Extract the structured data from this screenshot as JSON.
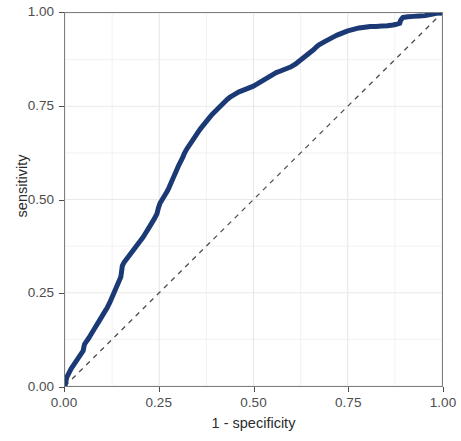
{
  "chart_data": {
    "type": "line",
    "title": "",
    "subtitle": "",
    "xlabel": "1 - specificity",
    "ylabel": "sensitivity",
    "xlim": [
      0,
      1
    ],
    "ylim": [
      0,
      1
    ],
    "xticks": [
      "0.00",
      "0.25",
      "0.50",
      "0.75",
      "1.00"
    ],
    "xtick_values": [
      0,
      0.25,
      0.5,
      0.75,
      1
    ],
    "yticks": [
      "0.00",
      "0.25",
      "0.50",
      "0.75",
      "1.00"
    ],
    "ytick_values": [
      0,
      0.25,
      0.5,
      0.75,
      1
    ],
    "grid": true,
    "grid_color": "#ebebeb",
    "legend": "none",
    "panel_background": "#ffffff",
    "panel_border_color": "#7f7f7f",
    "series": [
      {
        "name": "roc-curve",
        "color": "#1b3a75",
        "linewidth": 5,
        "linestyle": "solid",
        "x": [
          0.0,
          0.002,
          0.004,
          0.006,
          0.008,
          0.01,
          0.012,
          0.016,
          0.02,
          0.024,
          0.028,
          0.032,
          0.036,
          0.04,
          0.044,
          0.048,
          0.05,
          0.052,
          0.056,
          0.06,
          0.064,
          0.07,
          0.076,
          0.082,
          0.088,
          0.094,
          0.1,
          0.106,
          0.112,
          0.118,
          0.124,
          0.13,
          0.136,
          0.142,
          0.148,
          0.15,
          0.152,
          0.156,
          0.16,
          0.166,
          0.172,
          0.178,
          0.184,
          0.19,
          0.196,
          0.202,
          0.208,
          0.214,
          0.22,
          0.226,
          0.232,
          0.238,
          0.244,
          0.248,
          0.252,
          0.258,
          0.264,
          0.27,
          0.276,
          0.282,
          0.288,
          0.294,
          0.3,
          0.306,
          0.312,
          0.316,
          0.32,
          0.326,
          0.334,
          0.342,
          0.35,
          0.358,
          0.366,
          0.374,
          0.382,
          0.39,
          0.398,
          0.406,
          0.414,
          0.422,
          0.43,
          0.44,
          0.45,
          0.46,
          0.47,
          0.48,
          0.49,
          0.5,
          0.51,
          0.52,
          0.53,
          0.54,
          0.55,
          0.56,
          0.57,
          0.58,
          0.59,
          0.6,
          0.61,
          0.62,
          0.63,
          0.64,
          0.65,
          0.66,
          0.668,
          0.676,
          0.69,
          0.705,
          0.72,
          0.735,
          0.75,
          0.765,
          0.78,
          0.795,
          0.81,
          0.825,
          0.84,
          0.855,
          0.87,
          0.88,
          0.888,
          0.89,
          0.896,
          0.91,
          0.925,
          0.94,
          0.955,
          0.965,
          0.975,
          0.985,
          1.0
        ],
        "y": [
          0.0,
          0.012,
          0.02,
          0.026,
          0.03,
          0.034,
          0.038,
          0.046,
          0.052,
          0.058,
          0.064,
          0.07,
          0.076,
          0.082,
          0.088,
          0.094,
          0.104,
          0.112,
          0.118,
          0.124,
          0.13,
          0.14,
          0.15,
          0.16,
          0.17,
          0.18,
          0.19,
          0.2,
          0.21,
          0.222,
          0.236,
          0.25,
          0.264,
          0.278,
          0.292,
          0.306,
          0.322,
          0.33,
          0.336,
          0.344,
          0.352,
          0.36,
          0.368,
          0.376,
          0.384,
          0.392,
          0.4,
          0.41,
          0.42,
          0.43,
          0.44,
          0.45,
          0.462,
          0.478,
          0.49,
          0.5,
          0.51,
          0.52,
          0.532,
          0.546,
          0.56,
          0.574,
          0.588,
          0.6,
          0.612,
          0.622,
          0.63,
          0.64,
          0.652,
          0.664,
          0.676,
          0.688,
          0.698,
          0.708,
          0.718,
          0.728,
          0.736,
          0.744,
          0.752,
          0.76,
          0.768,
          0.776,
          0.782,
          0.788,
          0.792,
          0.796,
          0.8,
          0.804,
          0.81,
          0.816,
          0.822,
          0.828,
          0.834,
          0.84,
          0.844,
          0.848,
          0.852,
          0.856,
          0.862,
          0.87,
          0.878,
          0.886,
          0.894,
          0.902,
          0.91,
          0.916,
          0.924,
          0.932,
          0.94,
          0.946,
          0.952,
          0.956,
          0.96,
          0.962,
          0.964,
          0.964,
          0.965,
          0.966,
          0.968,
          0.97,
          0.972,
          0.98,
          0.988,
          0.99,
          0.991,
          0.992,
          0.993,
          0.995,
          0.997,
          0.999,
          1.0
        ]
      },
      {
        "name": "reference-diagonal",
        "color": "#4d4d4d",
        "linewidth": 1.3,
        "linestyle": "dashed",
        "x": [
          0,
          1
        ],
        "y": [
          0,
          1
        ]
      }
    ]
  },
  "axes": {
    "x_title": "1 - specificity",
    "y_title": "sensitivity"
  }
}
